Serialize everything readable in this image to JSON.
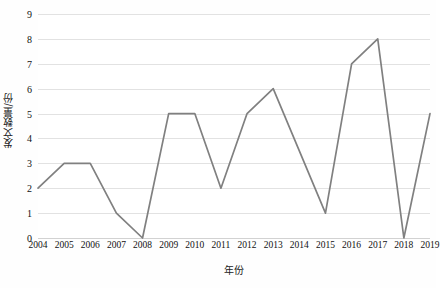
{
  "chart_data": {
    "type": "line",
    "title": "",
    "xlabel": "年份",
    "ylabel": "发文数量/份",
    "categories": [
      "2004",
      "2005",
      "2006",
      "2007",
      "2008",
      "2009",
      "2010",
      "2011",
      "2012",
      "2013",
      "2014",
      "2015",
      "2016",
      "2017",
      "2018",
      "2019"
    ],
    "values": [
      2,
      3,
      3,
      1,
      0,
      5,
      5,
      2,
      5,
      6,
      3.5,
      1,
      7,
      8,
      0,
      5
    ],
    "series": [
      {
        "name": "发文数量",
        "values": [
          2,
          3,
          3,
          1,
          0,
          5,
          5,
          2,
          5,
          6,
          3.5,
          1,
          7,
          8,
          0,
          5
        ]
      }
    ],
    "ylim": [
      0,
      9
    ],
    "yticks": [
      0,
      1,
      2,
      3,
      4,
      5,
      6,
      7,
      8,
      9
    ],
    "ytick_labels": [
      "0",
      "1",
      "2",
      "3",
      "4",
      "5",
      "6",
      "7",
      "8",
      "9"
    ],
    "xtick_labels": [
      "2004",
      "2005",
      "2006",
      "2007",
      "2008",
      "2009",
      "2010",
      "2011",
      "2012",
      "2013",
      "2014",
      "2015",
      "2016",
      "2017",
      "2018",
      "2019"
    ],
    "grid": true,
    "grid_axis": "y",
    "legend": false,
    "legend_position": "none",
    "markers": false,
    "line_color": "#808080",
    "grid_color": "#e2e2e2",
    "background_color": "#ffffff",
    "text_color": "#111111"
  }
}
